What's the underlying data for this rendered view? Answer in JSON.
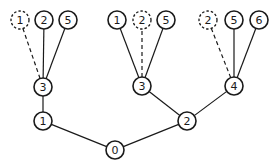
{
  "diagram": {
    "type": "tree",
    "nodes": [
      {
        "id": "n0",
        "label": "0",
        "x": 115,
        "y": 150,
        "style": "solid"
      },
      {
        "id": "n1",
        "label": "1",
        "x": 43,
        "y": 121,
        "style": "solid"
      },
      {
        "id": "n2",
        "label": "2",
        "x": 187,
        "y": 121,
        "style": "solid"
      },
      {
        "id": "n3a",
        "label": "3",
        "x": 43,
        "y": 87,
        "style": "solid"
      },
      {
        "id": "n3b",
        "label": "3",
        "x": 142,
        "y": 86,
        "style": "solid"
      },
      {
        "id": "n4",
        "label": "4",
        "x": 234,
        "y": 86,
        "style": "solid"
      },
      {
        "id": "l1",
        "label": "1",
        "x": 20,
        "y": 20,
        "style": "dashed"
      },
      {
        "id": "l2",
        "label": "2",
        "x": 44,
        "y": 20,
        "style": "solid"
      },
      {
        "id": "l5",
        "label": "5",
        "x": 68,
        "y": 20,
        "style": "solid"
      },
      {
        "id": "m1",
        "label": "1",
        "x": 117,
        "y": 20,
        "style": "solid"
      },
      {
        "id": "m2",
        "label": "2",
        "x": 142,
        "y": 20,
        "style": "dashed"
      },
      {
        "id": "m5",
        "label": "5",
        "x": 166,
        "y": 20,
        "style": "solid"
      },
      {
        "id": "r2",
        "label": "2",
        "x": 208,
        "y": 20,
        "style": "dashed"
      },
      {
        "id": "r5",
        "label": "5",
        "x": 234,
        "y": 20,
        "style": "solid"
      },
      {
        "id": "r6",
        "label": "6",
        "x": 259,
        "y": 20,
        "style": "solid"
      }
    ],
    "edges": [
      {
        "from": "n0",
        "to": "n1",
        "style": "solid"
      },
      {
        "from": "n0",
        "to": "n2",
        "style": "solid"
      },
      {
        "from": "n1",
        "to": "n3a",
        "style": "solid"
      },
      {
        "from": "n2",
        "to": "n3b",
        "style": "solid"
      },
      {
        "from": "n2",
        "to": "n4",
        "style": "solid"
      },
      {
        "from": "n3a",
        "to": "l1",
        "style": "dashed"
      },
      {
        "from": "n3a",
        "to": "l2",
        "style": "solid"
      },
      {
        "from": "n3a",
        "to": "l5",
        "style": "solid"
      },
      {
        "from": "n3b",
        "to": "m1",
        "style": "solid"
      },
      {
        "from": "n3b",
        "to": "m2",
        "style": "dashed"
      },
      {
        "from": "n3b",
        "to": "m5",
        "style": "solid"
      },
      {
        "from": "n4",
        "to": "r2",
        "style": "dashed"
      },
      {
        "from": "n4",
        "to": "r5",
        "style": "solid"
      },
      {
        "from": "n4",
        "to": "r6",
        "style": "solid"
      }
    ],
    "node_radius": 9,
    "colors": {
      "stroke": "#1a1a1a",
      "background": "#ffffff"
    }
  }
}
